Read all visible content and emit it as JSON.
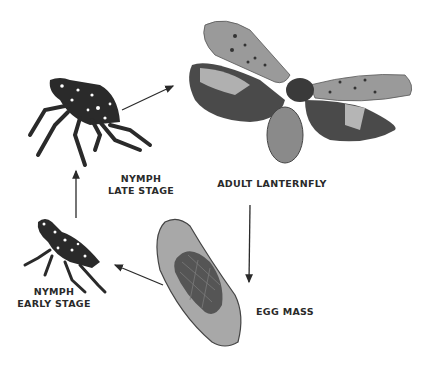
{
  "diagram": {
    "type": "lifecycle",
    "colors": {
      "ink": "#2a2a2a",
      "wing_light": "#9a9a9a",
      "wing_dark": "#4a4a4a",
      "egg_light": "#a8a8a8",
      "egg_dark": "#555555"
    },
    "stages": [
      {
        "id": "nymph-late",
        "line1": "NYMPH",
        "line2": "LATE STAGE"
      },
      {
        "id": "adult",
        "line1": "ADULT LANTERNFLY"
      },
      {
        "id": "egg",
        "line1": "EGG MASS"
      },
      {
        "id": "nymph-early",
        "line1": "NYMPH",
        "line2": "EARLY STAGE"
      }
    ],
    "arrows": [
      {
        "from": "nymph-late",
        "to": "adult"
      },
      {
        "from": "adult",
        "to": "egg"
      },
      {
        "from": "egg",
        "to": "nymph-early"
      },
      {
        "from": "nymph-early",
        "to": "nymph-late"
      }
    ]
  }
}
